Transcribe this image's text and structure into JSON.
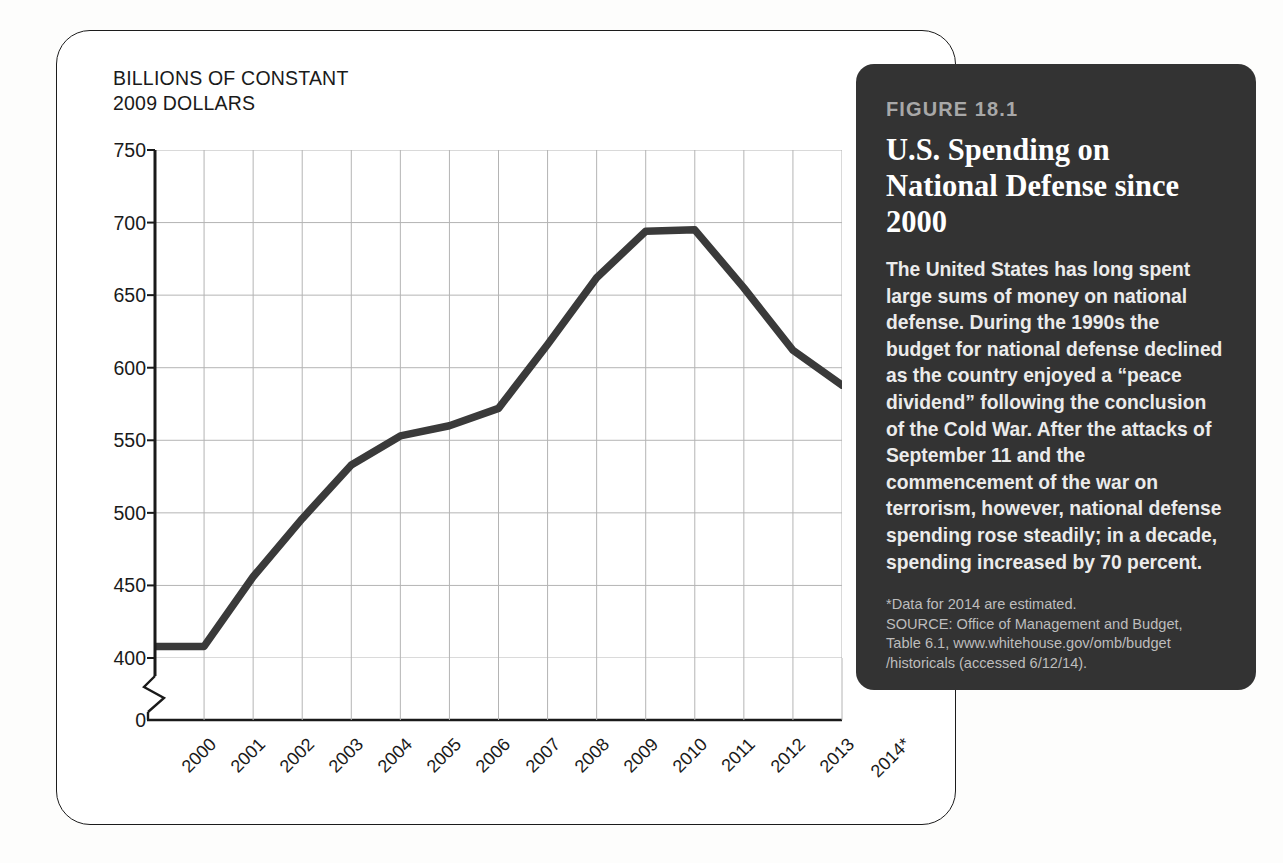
{
  "chart_data": {
    "type": "line",
    "title": "U.S. Spending on National Defense since 2000",
    "xlabel": "",
    "ylabel": "BILLIONS OF CONSTANT 2009 DOLLARS",
    "ylim": [
      400,
      750
    ],
    "ytick_values": [
      750,
      700,
      650,
      600,
      550,
      500,
      450,
      400,
      0
    ],
    "y_axis_break": true,
    "grid": true,
    "legend": "none",
    "categories": [
      "2000",
      "2001",
      "2002",
      "2003",
      "2004",
      "2005",
      "2006",
      "2007",
      "2008",
      "2009",
      "2010",
      "2011",
      "2012",
      "2013",
      "2014*"
    ],
    "values": [
      408,
      408,
      456,
      496,
      533,
      553,
      560,
      572,
      616,
      662,
      694,
      695,
      655,
      612,
      588
    ],
    "series": [
      {
        "name": "National defense outlays",
        "values": [
          408,
          408,
          456,
          496,
          533,
          553,
          560,
          572,
          616,
          662,
          694,
          695,
          655,
          612,
          588
        ]
      }
    ],
    "line_color": "#3a3a3a",
    "grid_color": "#b4b4b4"
  },
  "axis": {
    "y_title": "BILLIONS OF CONSTANT\n2009 DOLLARS"
  },
  "caption": {
    "figure_number": "FIGURE 18.1",
    "title": "U.S. Spending on National Defense since 2000",
    "body": "The United States has long spent large sums of money on national defense. During the 1990s the budget for national defense declined as the country enjoyed a “peace dividend” following the conclusion of the Cold War. After the attacks of September 11 and the commencement of the war on terrorism, however, national defense spending rose steadily; in a decade, spending increased by 70 percent.",
    "note": "*Data for 2014 are estimated.\nSOURCE: Office of Management and Budget,\nTable 6.1, www.whitehouse.gov/omb/budget\n/historicals (accessed 6/12/14)."
  },
  "colors": {
    "panel_background": "#333333",
    "figure_number": "#a8a8a8",
    "line": "#3a3a3a",
    "card_border": "#1c1c1c"
  }
}
